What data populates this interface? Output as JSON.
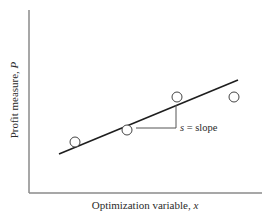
{
  "chart_data": {
    "type": "scatter",
    "title": "",
    "xlabel": "Optimization variable, x",
    "ylabel": "Profit measure, P",
    "grid": false,
    "legend": null,
    "points": [
      {
        "x": 75,
        "y": 142
      },
      {
        "x": 127,
        "y": 130
      },
      {
        "x": 177,
        "y": 97
      },
      {
        "x": 234,
        "y": 97
      }
    ],
    "fit_line": {
      "x1": 59,
      "y1": 154,
      "x2": 238,
      "y2": 80
    },
    "slope_annotation": {
      "label": "s = slope",
      "horizontal": {
        "x1": 136,
        "x2": 176,
        "y": 128
      },
      "vertical": {
        "x": 176,
        "y1": 105,
        "y2": 128
      }
    },
    "axes": {
      "origin_x": 29,
      "origin_y": 193,
      "x_end": 262,
      "y_top": 10
    },
    "colors": {
      "axis": "#8a8a8a",
      "line": "#1e1e1e",
      "marker": "#444444"
    }
  }
}
